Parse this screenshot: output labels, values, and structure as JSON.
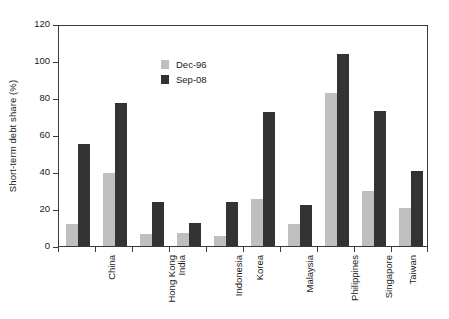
{
  "chart_data": {
    "type": "bar",
    "title": "",
    "xlabel": "",
    "ylabel": "Short-term debt share (%)",
    "ylim": [
      0,
      120
    ],
    "yticks": [
      0,
      20,
      40,
      60,
      80,
      100,
      120
    ],
    "grid": false,
    "legend_position": "inside-upper-left",
    "categories": [
      "China",
      "Hong Kong",
      "India",
      "Indonesia",
      "Korea",
      "Malaysia",
      "Philippines",
      "Singapore",
      "Taiwan",
      "Thailand"
    ],
    "series": [
      {
        "name": "Dec-96",
        "color": "#bfbfbf",
        "values": [
          12,
          39.5,
          6.5,
          7,
          5.5,
          25.5,
          12,
          82.5,
          30,
          20.5
        ]
      },
      {
        "name": "Sep-08",
        "color": "#333333",
        "values": [
          55,
          77.5,
          24,
          12.5,
          24,
          72.5,
          22,
          104,
          73,
          40.5
        ]
      }
    ]
  },
  "axis": {
    "y_title": "Short-term debt share (%)"
  }
}
